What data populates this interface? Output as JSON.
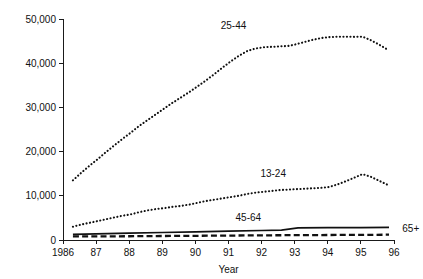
{
  "chart_data": {
    "type": "line",
    "title": "",
    "xlabel": "Year",
    "ylabel": "",
    "xlim": [
      1986,
      1996
    ],
    "ylim": [
      0,
      50000
    ],
    "grid": false,
    "legend_position": "inline-annotations",
    "x_tick_labels": [
      "1986",
      "87",
      "88",
      "89",
      "90",
      "91",
      "92",
      "93",
      "94",
      "95",
      "96"
    ],
    "x_tick_values": [
      1986,
      1987,
      1988,
      1989,
      1990,
      1991,
      1992,
      1993,
      1994,
      1995,
      1996
    ],
    "y_tick_labels": [
      "0",
      "10,000",
      "20,000",
      "30,000",
      "40,000",
      "50,000"
    ],
    "y_tick_values": [
      0,
      10000,
      20000,
      30000,
      40000,
      50000
    ],
    "series": [
      {
        "name": "25-44",
        "style": "dotted",
        "label_x": 1991.15,
        "label_y": 47800,
        "x": [
          1986.3,
          1986.55,
          1986.8,
          1987.05,
          1987.3,
          1987.55,
          1987.8,
          1988.05,
          1988.3,
          1988.55,
          1988.8,
          1989.05,
          1989.3,
          1989.55,
          1989.8,
          1990.05,
          1990.3,
          1990.55,
          1990.8,
          1991.05,
          1991.3,
          1991.55,
          1991.8,
          1992.05,
          1992.3,
          1992.55,
          1992.8,
          1993.05,
          1993.3,
          1993.55,
          1993.8,
          1994.05,
          1994.3,
          1994.55,
          1994.8,
          1995.05,
          1995.3,
          1995.55,
          1995.8
        ],
        "values": [
          13500,
          15200,
          16800,
          18300,
          19900,
          21400,
          22900,
          24300,
          25800,
          27100,
          28400,
          29700,
          31000,
          32200,
          33400,
          34700,
          36000,
          37400,
          38900,
          40300,
          41600,
          42700,
          43300,
          43600,
          43700,
          43800,
          43900,
          44300,
          44800,
          45300,
          45700,
          45900,
          46000,
          46000,
          45950,
          46000,
          45200,
          44200,
          43100
        ]
      },
      {
        "name": "13-24",
        "style": "dotted",
        "label_x": 1992.35,
        "label_y": 14200,
        "x": [
          1986.3,
          1986.55,
          1986.8,
          1987.05,
          1987.3,
          1987.55,
          1987.8,
          1988.05,
          1988.3,
          1988.55,
          1988.8,
          1989.05,
          1989.3,
          1989.55,
          1989.8,
          1990.05,
          1990.3,
          1990.55,
          1990.8,
          1991.05,
          1991.3,
          1991.55,
          1991.8,
          1992.05,
          1992.3,
          1992.55,
          1992.8,
          1993.05,
          1993.3,
          1993.55,
          1993.8,
          1994.05,
          1994.3,
          1994.55,
          1994.8,
          1995.05,
          1995.3,
          1995.55,
          1995.8
        ],
        "values": [
          3000,
          3500,
          3900,
          4300,
          4700,
          5100,
          5500,
          5800,
          6300,
          6700,
          7000,
          7200,
          7500,
          7700,
          8000,
          8400,
          8800,
          9100,
          9400,
          9700,
          10000,
          10400,
          10700,
          10900,
          11100,
          11300,
          11400,
          11500,
          11600,
          11700,
          11800,
          12000,
          12600,
          13300,
          14100,
          14900,
          14300,
          13400,
          12500
        ]
      },
      {
        "name": "45-64",
        "style": "solid",
        "label_x": 1991.6,
        "label_y": 4300,
        "x": [
          1986.3,
          1987.0,
          1988.0,
          1989.0,
          1990.0,
          1991.0,
          1992.0,
          1992.6,
          1993.1,
          1994.0,
          1995.0,
          1995.85
        ],
        "values": [
          1250,
          1400,
          1550,
          1700,
          1850,
          2000,
          2150,
          2250,
          2750,
          2800,
          2800,
          2850
        ]
      },
      {
        "name": "65+",
        "style": "dashed",
        "label_x": 1996.25,
        "label_y": 1900,
        "x": [
          1986.3,
          1987.0,
          1988.0,
          1989.0,
          1990.0,
          1991.0,
          1992.0,
          1993.0,
          1994.0,
          1995.0,
          1995.85
        ],
        "values": [
          800,
          820,
          850,
          900,
          950,
          1000,
          1050,
          1100,
          1130,
          1160,
          1200
        ]
      }
    ]
  }
}
